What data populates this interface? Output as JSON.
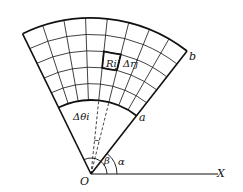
{
  "diagram": {
    "type": "polar-grid-sector",
    "origin_label": "O",
    "axis_label": "X",
    "inner_arc_label": "a",
    "outer_arc_label": "b",
    "cell_label": "Rij",
    "radial_step_label": "Δrj",
    "angular_step_label": "Δθi",
    "angle_alpha_label": "α",
    "angle_beta_label": "β",
    "geometry": {
      "origin": [
        91,
        174
      ],
      "alpha_deg": 52,
      "beta_deg": 116,
      "inner_radius": 74,
      "outer_radius": 156,
      "radial_divisions": 5,
      "angular_divisions": 8
    },
    "colors": {
      "stroke": "#111111",
      "background": "#ffffff"
    }
  }
}
